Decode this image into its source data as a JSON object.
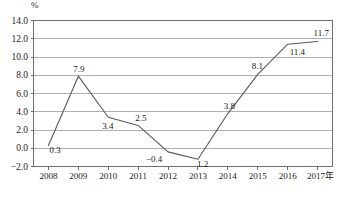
{
  "chart_data": {
    "type": "line",
    "title": "",
    "subtitle": "",
    "xlabel": "",
    "ylabel": "%",
    "unit_label": "%",
    "x_axis_suffix": "年",
    "categories": [
      "2008",
      "2009",
      "2010",
      "2011",
      "2012",
      "2013",
      "2014",
      "2015",
      "2016",
      "2017"
    ],
    "tick_labels_x": [
      "2008",
      "2009",
      "2010",
      "2011",
      "2012",
      "2013",
      "2014",
      "2015",
      "2016",
      "2017年"
    ],
    "values": [
      0.3,
      7.9,
      3.4,
      2.5,
      -0.4,
      -1.2,
      3.8,
      8.1,
      11.4,
      11.7
    ],
    "point_labels": [
      "0.3",
      "7.9",
      "3.4",
      "2.5",
      "−0.4",
      "1.2",
      "3.8",
      "8.1",
      "11.4",
      "11.7"
    ],
    "ylim": [
      -2.0,
      14.0
    ],
    "ytick_values": [
      14.0,
      12.0,
      10.0,
      8.0,
      6.0,
      4.0,
      2.0,
      0.0,
      -2.0
    ],
    "ytick_labels": [
      "14.0",
      "12.0",
      "10.0",
      "8.0",
      "6.0",
      "4.0",
      "2.0",
      "0.0",
      "−2.0"
    ],
    "grid": true,
    "legend": "none",
    "line_color": "#595959",
    "grid_color": "#b0b0b0",
    "axis_color": "#6e6e6e",
    "text_color": "#1a1a1a"
  },
  "caption": {
    "text": ""
  }
}
